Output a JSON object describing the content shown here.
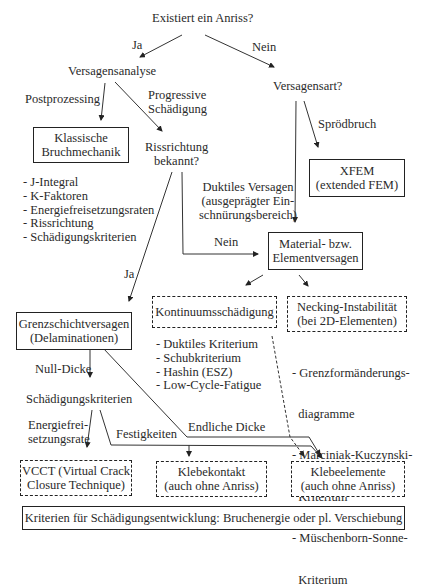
{
  "diagram": {
    "root_question": "Existiert ein Anriss?",
    "edges": {
      "ja_top": "Ja",
      "nein_top": "Nein",
      "postprozessing": "Postprozessing",
      "progressive_1": "Progressive",
      "progressive_2": "Schädigung",
      "sproedbruch": "Sprödbruch",
      "duktil_1": "Duktiles Versagen",
      "duktil_2": "(ausgeprägter Ein-",
      "duktil_3": "schnürungsbereich)",
      "nein_mid": "Nein",
      "ja_mid": "Ja",
      "null_dicke": "Null-Dicke",
      "energie_1": "Energiefrei-",
      "energie_2": "setzungsrate",
      "festigkeiten": "Festigkeiten",
      "endliche_dicke": "Endliche Dicke"
    },
    "nodes": {
      "versagensanalyse": "Versagensanalyse",
      "versagensart": "Versagensart?",
      "klassische_1": "Klassische",
      "klassische_2": "Bruchmechanik",
      "rissrichtung_1": "Rissrichtung",
      "rissrichtung_2": "bekannt?",
      "xfem_1": "XFEM",
      "xfem_2": "(extended FEM)",
      "material_1": "Material- bzw.",
      "material_2": "Elementversagen",
      "kontinuum": "Kontinuumsschädigung",
      "necking_1": "Necking-Instabilität",
      "necking_2": "(bei 2D-Elementen)",
      "grenzschicht_1": "Grenzschichtversagen",
      "grenzschicht_2": "(Delaminationen)",
      "schaedigungskriterien": "Schädigungskriterien",
      "vcct_1": "VCCT (Virtual Crack",
      "vcct_2": "Closure Technique)",
      "klebekontakt_1": "Klebekontakt",
      "klebekontakt_2": "(auch ohne Anriss)",
      "klebeelemente_1": "Klebeelemente",
      "klebeelemente_2": "(auch ohne Anriss)",
      "footer": "Kriterien für Schädigungsentwicklung: Bruchenergie oder pl. Verschiebung"
    },
    "lists": {
      "bruchmechanik": [
        "- J-Integral",
        "- K-Faktoren",
        "- Energiefreisetzungsraten",
        "- Rissrichtung",
        "- Schädigungskriterien"
      ],
      "kontinuum": [
        "- Duktiles Kriterium",
        "- Schubkriterium",
        "- Hashin (ESZ)",
        "- Low-Cycle-Fatigue"
      ],
      "necking": [
        "- Grenzformänderungs-",
        "  diagramme",
        "- Marciniak-Kuczynski-",
        "  Kriterium",
        "- Müschenborn-Sonne-",
        "  Kriterium"
      ]
    }
  }
}
